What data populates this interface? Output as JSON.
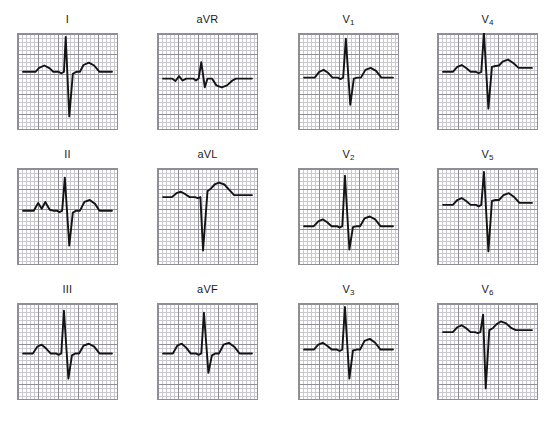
{
  "figure": {
    "title": "",
    "background_color": "#ffffff",
    "grid_minor_color": "#c9c9cf",
    "grid_major_color": "#8e8e96",
    "grid_border_color": "#8e8e96",
    "trace_color": "#141414",
    "label_color": "#1a1a1a",
    "rows": 3,
    "columns": 4,
    "panel_width": 101,
    "panel_height": 97,
    "minor_cell_px": 4,
    "major_every": 5
  },
  "chart_data": {
    "type": "line",
    "xlabel": "",
    "ylabel": "",
    "grid": true,
    "legend": "none",
    "layout": "3 rows x 4 columns of lead panels",
    "x_units": "time (small box = 0.04 s)",
    "y_units": "amplitude (small box = 0.1 mV)",
    "panels": [
      {
        "label": "I",
        "label_main": "I",
        "label_sub": "",
        "row": 0,
        "col": 0,
        "baseline_frac": 0.4,
        "qrs_axis": "upright",
        "description": "small P wave, tall narrow R wave, very deep S wave, broad upright T wave",
        "points": "0,0 14,0 18,-4 24,-6.5 30,-3.5 34,0 40,0 43,1.5 46,0 48,-36 52,46 56,2 60,0 64,0 68,-7 74,-9.5 80,-6.5 86,0 100,0"
      },
      {
        "label": "aVR",
        "label_main": "aVR",
        "label_sub": "",
        "row": 0,
        "col": 1,
        "baseline_frac": 0.47,
        "qrs_axis": "small upright",
        "description": "tiny wavy P, small upright R spike, shallow inverted T wave",
        "points": "0,0 10,0 14,2.5 18,-2.5 22,2 26,0 34,0 37,2 40,0 43,-17 47,9 50,0 55,0 60,7 66,9 72,7 78,2 82,0 100,0"
      },
      {
        "label": "V1",
        "label_main": "V",
        "label_sub": "1",
        "row": 0,
        "col": 2,
        "baseline_frac": 0.46,
        "qrs_axis": "upright",
        "description": "small rounded P, very tall R wave, deep S wave, rounded upright T wave",
        "points": "0,0 12,0 17,-6 22,-8 27,-5 32,0 38,0 41,1.5 44,0 47,-40 52,28 56,1 60,0 64,0 69,-8 75,-10 81,-7 87,0 100,0"
      },
      {
        "label": "V4",
        "label_main": "V",
        "label_sub": "4",
        "row": 0,
        "col": 3,
        "baseline_frac": 0.4,
        "qrs_axis": "upright",
        "description": "small P wave, very tall narrow R wave, deep S wave with elevated take-off, broad T wave",
        "points": "0,0 11,0 16,-5 21,-7 26,-4 31,0 37,0 40,1.5 43,0 46,-40 51,38 55,-5 59,-6 63,-6.5 67,-10.5 73,-12.5 79,-9 85,-4 90,-4 100,-4"
      },
      {
        "label": "II",
        "label_main": "II",
        "label_sub": "",
        "row": 1,
        "col": 0,
        "baseline_frac": 0.44,
        "qrs_axis": "upright",
        "description": "notched P wave, tall R wave, deep S wave, broad rounded T wave",
        "points": "0,0 12,0 17,-8 21,-2 25,-9 30,-1 34,0 38,0 41,1.5 44,0 47,-34 52,36 56,2 60,0 64,0 69,-9 75,-11 81,-7 86,0 100,0"
      },
      {
        "label": "aVL",
        "label_main": "aVL",
        "label_sub": "",
        "row": 1,
        "col": 1,
        "baseline_frac": 0.3,
        "qrs_axis": "negative",
        "description": "small P wave, very deep QS complex, large broad upright T wave",
        "points": "0,0 10,0 15,-4 20,-5.5 25,-3 30,0 36,0 39,1 42,0 45,55 50,-6 54,-9 58,-13 63,-15 69,-13 75,-7 80,-2 85,-2 100,-2"
      },
      {
        "label": "V2",
        "label_main": "V",
        "label_sub": "2",
        "row": 1,
        "col": 2,
        "baseline_frac": 0.6,
        "qrs_axis": "upright",
        "description": "small P wave, very tall R wave reaching top of panel, deep S wave, upright T wave",
        "points": "0,0 11,0 16,-5 21,-7 26,-4 31,0 37,0 40,1.5 43,0 46,-52 51,24 55,1 59,0 63,0 68,-8 74,-10 80,-7 86,0 100,0"
      },
      {
        "label": "V5",
        "label_main": "V",
        "label_sub": "5",
        "row": 1,
        "col": 3,
        "baseline_frac": 0.38,
        "qrs_axis": "upright",
        "description": "small P wave, tall R wave, very deep S wave extending low, broad T wave",
        "points": "0,0 11,0 16,-5 21,-7 26,-4 31,0 37,0 40,1.5 43,0 46,-34 51,48 55,-4 59,-5 63,-5 68,-10 74,-12 80,-8 86,-2 100,-2"
      },
      {
        "label": "III",
        "label_main": "III",
        "label_sub": "",
        "row": 2,
        "col": 0,
        "baseline_frac": 0.52,
        "qrs_axis": "upright",
        "description": "small P wave, very tall R wave, deep S wave, rounded upright T wave",
        "points": "0,0 11,0 16,-7 21,-9 26,-5 31,0 37,0 40,1.5 43,0 46,-44 51,26 55,2 59,0 63,0 68,-8 74,-10 80,-7 86,0 100,0"
      },
      {
        "label": "aVF",
        "label_main": "aVF",
        "label_sub": "",
        "row": 2,
        "col": 1,
        "baseline_frac": 0.52,
        "qrs_axis": "upright",
        "description": "rounded P wave, tall R wave, moderate S wave, broad upright T wave",
        "points": "0,0 11,0 16,-8 21,-10 26,-6 31,0 37,0 40,1.5 43,0 46,-42 51,20 55,2 59,0 63,0 68,-9 74,-11 80,-7 86,0 100,0"
      },
      {
        "label": "V3",
        "label_main": "V",
        "label_sub": "3",
        "row": 2,
        "col": 2,
        "baseline_frac": 0.48,
        "qrs_axis": "upright",
        "description": "small P wave, tall narrow R wave, deep S wave, rounded upright T wave",
        "points": "0,0 11,0 16,-5 21,-7 26,-4 31,0 37,0 40,1.5 43,0 46,-44 51,30 55,1 59,0 63,0 68,-9 74,-11 80,-7 86,0 100,0"
      },
      {
        "label": "V6",
        "label_main": "V",
        "label_sub": "6",
        "row": 2,
        "col": 3,
        "baseline_frac": 0.3,
        "qrs_axis": "negative",
        "description": "small P wave, narrow tall R then very deep S wave, upright T wave",
        "points": "0,0 11,0 16,-5 21,-7 26,-4 31,0 36,0 39,1 42,0 45,-18 48,58 52,-2 56,-4 60,-8 65,-11 71,-9 77,-4 82,-2 100,-2"
      }
    ]
  }
}
